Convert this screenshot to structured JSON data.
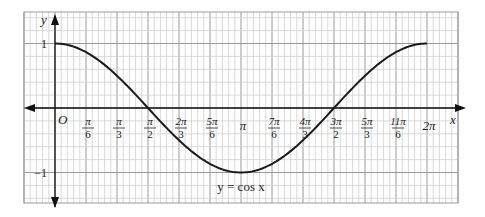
{
  "chart_data": {
    "type": "line",
    "title": "",
    "function_label": "y = cos x",
    "xlabel": "x",
    "ylabel": "y",
    "origin_label": "O",
    "xlim": [
      0,
      6.2832
    ],
    "ylim": [
      -1,
      1
    ],
    "grid": true,
    "x_ticks": [
      {
        "value": 0.5236,
        "num": "π",
        "den": "6"
      },
      {
        "value": 1.0472,
        "num": "π",
        "den": "3"
      },
      {
        "value": 1.5708,
        "num": "π",
        "den": "2"
      },
      {
        "value": 2.0944,
        "num": "2π",
        "den": "3"
      },
      {
        "value": 2.618,
        "num": "5π",
        "den": "6"
      },
      {
        "value": 3.1416,
        "num": "π",
        "den": ""
      },
      {
        "value": 3.6652,
        "num": "7π",
        "den": "6"
      },
      {
        "value": 4.1888,
        "num": "4π",
        "den": "3"
      },
      {
        "value": 4.7124,
        "num": "3π",
        "den": "2"
      },
      {
        "value": 5.236,
        "num": "5π",
        "den": "3"
      },
      {
        "value": 5.7596,
        "num": "11π",
        "den": "6"
      },
      {
        "value": 6.2832,
        "num": "2π",
        "den": ""
      }
    ],
    "y_ticks": [
      {
        "value": 1,
        "label": "1"
      },
      {
        "value": -1,
        "label": "−1"
      }
    ],
    "series": [
      {
        "name": "y = cos x",
        "x": [
          0,
          0.5236,
          1.0472,
          1.5708,
          2.0944,
          2.618,
          3.1416,
          3.6652,
          4.1888,
          4.7124,
          5.236,
          5.7596,
          6.2832
        ],
        "y": [
          1,
          0.866,
          0.5,
          0,
          -0.5,
          -0.866,
          -1,
          -0.866,
          -0.5,
          0,
          0.5,
          0.866,
          1
        ]
      }
    ]
  }
}
